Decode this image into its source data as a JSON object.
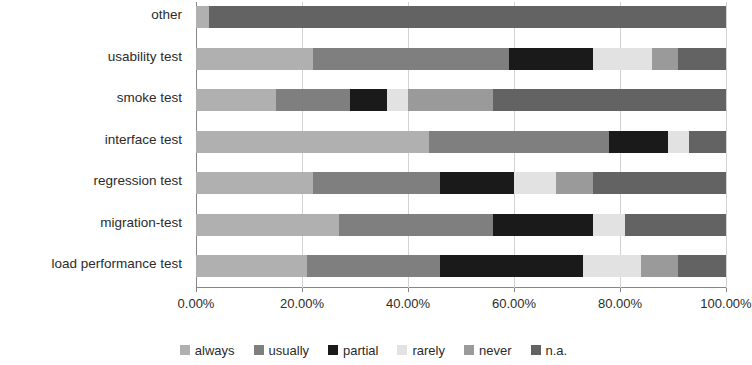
{
  "chart_data": {
    "type": "bar",
    "orientation": "horizontal",
    "stacked": true,
    "normalized_percent": true,
    "title": "",
    "xlabel": "",
    "ylabel": "",
    "xlim": [
      0,
      100
    ],
    "grid": true,
    "legend_position": "bottom",
    "tick_labels": [
      "0.00%",
      "20.00%",
      "40.00%",
      "60.00%",
      "80.00%",
      "100.00%"
    ],
    "tick_values": [
      0,
      20,
      40,
      60,
      80,
      100
    ],
    "categories": [
      "other",
      "usability test",
      "smoke test",
      "interface test",
      "regression test",
      "migration-test",
      "load performance test"
    ],
    "series": [
      {
        "name": "always",
        "color": "#b0b0b0",
        "values": [
          2.5,
          22.0,
          15.0,
          44.0,
          22.0,
          27.0,
          21.0
        ]
      },
      {
        "name": "usually",
        "color": "#7f7f7f",
        "values": [
          0.0,
          37.0,
          14.0,
          34.0,
          24.0,
          29.0,
          25.0
        ]
      },
      {
        "name": "partial",
        "color": "#1a1a1a",
        "values": [
          0.0,
          16.0,
          7.0,
          11.0,
          14.0,
          19.0,
          27.0
        ]
      },
      {
        "name": "rarely",
        "color": "#e2e2e2",
        "values": [
          0.0,
          11.0,
          4.0,
          4.0,
          8.0,
          6.0,
          11.0
        ]
      },
      {
        "name": "never",
        "color": "#9a9a9a",
        "values": [
          0.0,
          5.0,
          16.0,
          0.0,
          7.0,
          0.0,
          7.0
        ]
      },
      {
        "name": "n.a.",
        "color": "#636363",
        "values": [
          97.5,
          9.0,
          44.0,
          7.0,
          25.0,
          19.0,
          9.0
        ]
      }
    ]
  },
  "legend": {
    "items": [
      {
        "label": "always"
      },
      {
        "label": "usually"
      },
      {
        "label": "partial"
      },
      {
        "label": "rarely"
      },
      {
        "label": "never"
      },
      {
        "label": "n.a."
      }
    ]
  }
}
